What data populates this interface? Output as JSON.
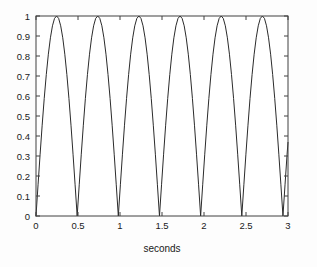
{
  "chart_data": {
    "type": "line",
    "title": "",
    "subtitle": "",
    "xlabel": "seconds",
    "ylabel": "",
    "xlim": [
      0,
      3
    ],
    "ylim": [
      0,
      1
    ],
    "grid": false,
    "legend": null,
    "legend_position": "none",
    "annotations": [],
    "line_color": "#2b2b2b",
    "axis_color": "#404040",
    "background_color": "#fdfdfd",
    "xticks": [
      0,
      0.5,
      1,
      1.5,
      2,
      2.5,
      3
    ],
    "xticklabels": [
      "0",
      "0.5",
      "1",
      "1.5",
      "2",
      "2.5",
      "3"
    ],
    "yticks": [
      0,
      0.1,
      0.2,
      0.3,
      0.4,
      0.5,
      0.6,
      0.7,
      0.8,
      0.9,
      1
    ],
    "yticklabels": [
      "0",
      "0.1",
      "0.2",
      "0.3",
      "0.4",
      "0.5",
      "0.6",
      "0.7",
      "0.8",
      "0.9",
      "1"
    ],
    "series": [
      {
        "name": "rectified sine",
        "description": "absolute value of a sine wave, |sin(pi*t/0.49)|",
        "period_seconds": 0.49,
        "peak_value": 1,
        "trough_value": 0,
        "peak_times": [
          0.245,
          0.735,
          1.225,
          1.715,
          2.205,
          2.695
        ],
        "trough_times": [
          0,
          0.49,
          0.98,
          1.47,
          1.96,
          2.45,
          2.94
        ],
        "x": [
          0,
          0.0245,
          0.049,
          0.0735,
          0.098,
          0.1225,
          0.147,
          0.1715,
          0.196,
          0.2205,
          0.245,
          0.2695,
          0.294,
          0.3185,
          0.343,
          0.3675,
          0.392,
          0.4165,
          0.441,
          0.4655,
          0.49,
          0.5145,
          0.539,
          0.5635,
          0.588,
          0.6125,
          0.637,
          0.6615,
          0.686,
          0.7105,
          0.735,
          0.7595,
          0.784,
          0.8085,
          0.833,
          0.8575,
          0.882,
          0.9065,
          0.931,
          0.9555,
          0.98,
          1.0045,
          1.029,
          1.0535,
          1.078,
          1.1025,
          1.127,
          1.1515,
          1.176,
          1.2005,
          1.225,
          1.2495,
          1.274,
          1.2985,
          1.323,
          1.3475,
          1.372,
          1.3965,
          1.421,
          1.4455,
          1.47,
          1.4945,
          1.519,
          1.5435,
          1.568,
          1.5925,
          1.617,
          1.6415,
          1.666,
          1.6905,
          1.715,
          1.7395,
          1.764,
          1.7885,
          1.813,
          1.8375,
          1.862,
          1.8865,
          1.911,
          1.9355,
          1.96,
          1.9845,
          2.009,
          2.0335,
          2.058,
          2.0825,
          2.107,
          2.1315,
          2.156,
          2.1805,
          2.205,
          2.2295,
          2.254,
          2.2785,
          2.303,
          2.3275,
          2.352,
          2.3765,
          2.401,
          2.4255,
          2.45,
          2.4745,
          2.499,
          2.5235,
          2.548,
          2.5725,
          2.597,
          2.6215,
          2.646,
          2.6705,
          2.695,
          2.7195,
          2.744,
          2.7685,
          2.793,
          2.8175,
          2.842,
          2.8665,
          2.891,
          2.9155,
          2.94,
          2.9645,
          2.989,
          3.0
        ],
        "y": [
          0,
          0.156,
          0.309,
          0.454,
          0.588,
          0.707,
          0.809,
          0.891,
          0.951,
          0.988,
          1.0,
          0.988,
          0.951,
          0.891,
          0.809,
          0.707,
          0.588,
          0.454,
          0.309,
          0.156,
          0,
          0.156,
          0.309,
          0.454,
          0.588,
          0.707,
          0.809,
          0.891,
          0.951,
          0.988,
          1.0,
          0.988,
          0.951,
          0.891,
          0.809,
          0.707,
          0.588,
          0.454,
          0.309,
          0.156,
          0,
          0.156,
          0.309,
          0.454,
          0.588,
          0.707,
          0.809,
          0.891,
          0.951,
          0.988,
          1.0,
          0.988,
          0.951,
          0.891,
          0.809,
          0.707,
          0.588,
          0.454,
          0.309,
          0.156,
          0,
          0.156,
          0.309,
          0.454,
          0.588,
          0.707,
          0.809,
          0.891,
          0.951,
          0.988,
          1.0,
          0.988,
          0.951,
          0.891,
          0.809,
          0.707,
          0.588,
          0.454,
          0.309,
          0.156,
          0,
          0.156,
          0.309,
          0.454,
          0.588,
          0.707,
          0.809,
          0.891,
          0.951,
          0.988,
          1.0,
          0.988,
          0.951,
          0.891,
          0.809,
          0.707,
          0.588,
          0.454,
          0.309,
          0.156,
          0,
          0.156,
          0.309,
          0.454,
          0.588,
          0.707,
          0.809,
          0.891,
          0.951,
          0.988,
          1.0,
          0.988,
          0.951,
          0.891,
          0.809,
          0.707,
          0.588,
          0.454,
          0.309,
          0.156,
          0,
          0.156,
          0.309,
          0.368
        ]
      }
    ]
  },
  "figure": {
    "xlabel_text": "seconds"
  }
}
